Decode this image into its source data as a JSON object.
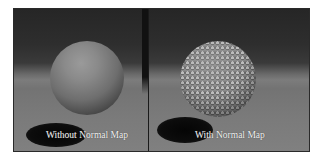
{
  "figure": {
    "panels": [
      {
        "id": "without",
        "caption": "Without Normal Map",
        "surface": "smooth"
      },
      {
        "id": "with",
        "caption": "With Normal Map",
        "surface": "dimpled"
      }
    ]
  },
  "colors": {
    "border": "#2a2a2a",
    "background_top": "#262626",
    "floor": "#7a7a7a",
    "caption": "#f2f2f2"
  }
}
